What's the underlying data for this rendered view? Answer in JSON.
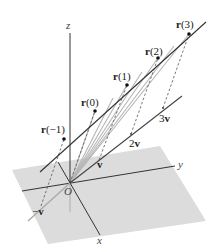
{
  "figure": {
    "axes": {
      "x": "x",
      "y": "y",
      "z": "z",
      "origin": "O"
    },
    "line_points": [
      {
        "label_bold": "r",
        "label_arg": "(−1)"
      },
      {
        "label_bold": "r",
        "label_arg": "(0)"
      },
      {
        "label_bold": "r",
        "label_arg": "(1)"
      },
      {
        "label_bold": "r",
        "label_arg": "(2)"
      },
      {
        "label_bold": "r",
        "label_arg": "(3)"
      }
    ],
    "vector_multiples": [
      {
        "coef": "−",
        "vec": "v"
      },
      {
        "coef": "",
        "vec": "v"
      },
      {
        "coef": "2",
        "vec": "v"
      },
      {
        "coef": "3",
        "vec": "v"
      }
    ],
    "colors": {
      "plane": "#d9d9d9",
      "axis": "#333333",
      "line": "#333333",
      "rays": "#b8b8b8",
      "dashed": "#555555"
    }
  }
}
